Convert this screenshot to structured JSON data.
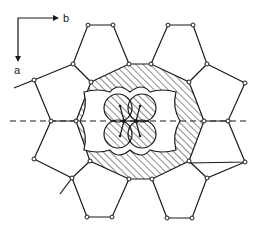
{
  "figure": {
    "axes": {
      "horizontal_label": "b",
      "vertical_label": "a"
    },
    "colors": {
      "line": "#1a1a1a",
      "background": "#ffffff",
      "hatch": "#1a1a1a"
    }
  }
}
